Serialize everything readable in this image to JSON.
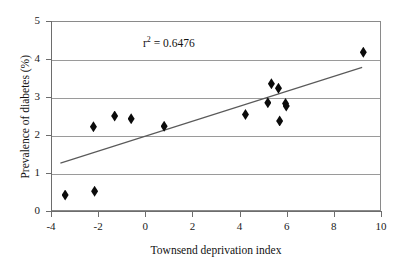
{
  "chart_data": {
    "type": "scatter",
    "title": "",
    "xlabel": "Townsend deprivation index",
    "ylabel": "Prevalence of diabetes (%)",
    "xlim": [
      -4,
      10
    ],
    "ylim": [
      0,
      5
    ],
    "xticks": [
      -4,
      -2,
      0,
      2,
      4,
      6,
      8,
      10
    ],
    "yticks": [
      0,
      1,
      2,
      3,
      4,
      5
    ],
    "xtick_labels": [
      "-4",
      "-2",
      "0",
      "2",
      "4",
      "6",
      "8",
      "10"
    ],
    "ytick_labels": [
      "0",
      "1",
      "2",
      "3",
      "4",
      "5"
    ],
    "grid": "horizontal",
    "legend": "none",
    "marker": "filled-diamond",
    "marker_color": "#0b0b0b",
    "gridline_color": "#9a9a9a",
    "axis_color": "#6d6d6d",
    "background_color": "#ffffff",
    "annotations": [
      {
        "name": "r-squared",
        "text_prefix": "r",
        "text_superscript": "2",
        "text_suffix": " = 0.6476",
        "value": 0.6476,
        "x": 2.2,
        "y": 4.55
      }
    ],
    "points": [
      {
        "x": -3.4,
        "y": 0.42
      },
      {
        "x": -2.15,
        "y": 0.52
      },
      {
        "x": -2.2,
        "y": 2.22
      },
      {
        "x": -1.3,
        "y": 2.5
      },
      {
        "x": -0.6,
        "y": 2.43
      },
      {
        "x": 0.8,
        "y": 2.23
      },
      {
        "x": 4.25,
        "y": 2.54
      },
      {
        "x": 5.2,
        "y": 2.85
      },
      {
        "x": 5.35,
        "y": 3.35
      },
      {
        "x": 5.65,
        "y": 3.23
      },
      {
        "x": 5.7,
        "y": 2.37
      },
      {
        "x": 5.95,
        "y": 2.83
      },
      {
        "x": 5.98,
        "y": 2.76
      },
      {
        "x": 9.25,
        "y": 4.18
      }
    ],
    "trendline": {
      "type": "linear-fit",
      "x_start": -3.6,
      "y_start": 1.26,
      "x_end": 9.2,
      "y_end": 3.78,
      "color": "#5a5a5a",
      "r_squared": 0.6476
    }
  }
}
